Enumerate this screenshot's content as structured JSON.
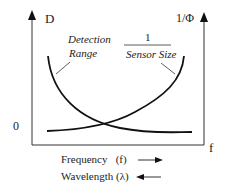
{
  "diagram": {
    "left_axis_label": "D",
    "right_axis_label": "1/Φ",
    "x_axis_end_label": "f",
    "origin_label": "0",
    "curves": [
      {
        "name": "detection-range",
        "label_line1": "Detection",
        "label_line2": "Range",
        "trend": "decreasing"
      },
      {
        "name": "inverse-sensor-size",
        "numerator": "1",
        "denominator": "Sensor Size",
        "trend": "increasing"
      }
    ],
    "legend": {
      "frequency": "Frequency   (f)",
      "wavelength": "Wavelength (λ)"
    },
    "colors": {
      "line": "#222222",
      "text": "#222222"
    }
  }
}
